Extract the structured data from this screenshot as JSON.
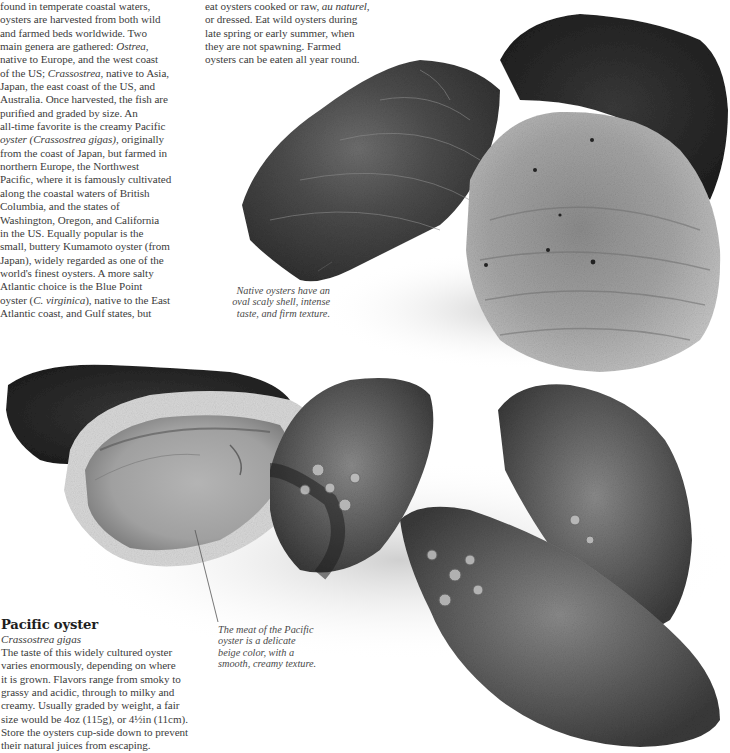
{
  "intro": {
    "left_column_lines": [
      "found in temperate coastal waters,",
      "oysters are harvested from both wild",
      "and farmed beds worldwide. Two",
      [
        "main genera are gathered: ",
        {
          "i": "Ostrea"
        },
        ","
      ],
      "native to Europe, and the west coast",
      [
        "of the US; ",
        {
          "i": "Crassostrea"
        },
        ", native to Asia,"
      ],
      "Japan, the east coast of the US, and",
      "Australia. Once harvested, the fish are",
      "purified and graded by size. An",
      "all-time favorite is the creamy Pacific",
      [
        {
          "i": "oyster (Crassostrea gigas)"
        },
        ", originally"
      ],
      "from the coast of Japan, but farmed in",
      "northern Europe, the Northwest",
      "Pacific, where it is famously cultivated",
      "along the coastal waters of British",
      "Columbia, and the states of",
      "Washington, Oregon, and California",
      "in the US. Equally popular is the",
      "small, buttery Kumamoto oyster (from",
      "Japan), widely regarded as one of the",
      "world's finest oysters. A more salty",
      "Atlantic choice is the Blue Point",
      [
        "oyster (",
        {
          "i": "C. virginica"
        },
        "), native to the East"
      ],
      "Atlantic coast, and Gulf states, but"
    ],
    "right_column_lines": [
      [
        "eat oysters cooked or raw, ",
        {
          "i": "au naturel"
        },
        ","
      ],
      "or dressed. Eat wild oysters during",
      "late spring or early summer, when",
      "they are not spawning. Farmed",
      "oysters can be eaten all year round."
    ]
  },
  "captions": {
    "native": [
      "Native oysters have an",
      "oval scaly shell, intense",
      "taste, and firm texture."
    ],
    "pacific_meat": [
      "The meat of the Pacific",
      "oyster is a delicate",
      "beige color, with a",
      "smooth, creamy texture."
    ]
  },
  "pacific_oyster": {
    "heading": "Pacific oyster",
    "latin_name": "Crassostrea gigas",
    "description_lines": [
      "The taste of this widely cultured oyster",
      "varies enormously, depending on where",
      "it is grown. Flavors range from smoky to",
      "grassy and acidic, through to milky and",
      "creamy. Usually graded by weight, a fair",
      "size would be 4oz (115g), or 4½in (11cm).",
      "Store the oysters cup-side down to prevent",
      "their natural juices from escaping."
    ]
  },
  "images": {
    "native_oysters_photo": "three native oysters (Ostrea) - dark scaly shells",
    "pacific_oysters_photo": "Pacific oysters, one opened showing beige meat, others with barnacles"
  }
}
